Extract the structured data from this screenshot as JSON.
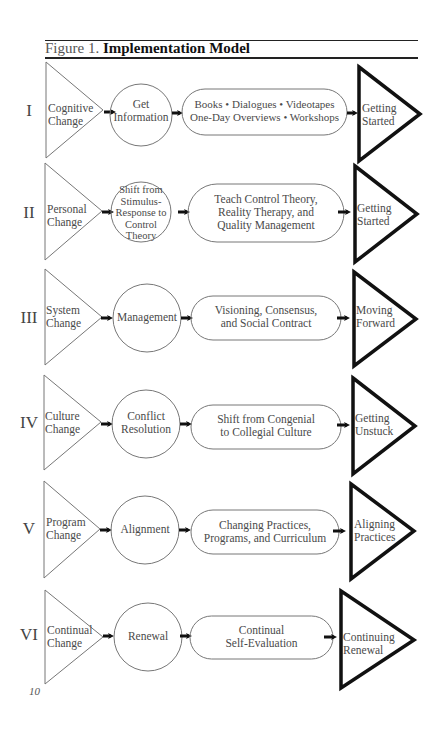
{
  "figure": {
    "prefix": "Figure 1.",
    "title": "Implementation Model"
  },
  "rows": [
    {
      "numeral": "I",
      "change": "Cognitive\nChange",
      "process": "Get\nInformation",
      "activities": "Books • Dialogues • Videotapes\nOne-Day Overviews • Workshops",
      "outcome": "Getting\nStarted"
    },
    {
      "numeral": "II",
      "change": "Personal\nChange",
      "process": "Shift from\nStimulus-\nResponse to\nControl\nTheory",
      "activities": "Teach Control Theory,\nReality Therapy, and\nQuality Management",
      "outcome": "Getting\nStarted"
    },
    {
      "numeral": "III",
      "change": "System\nChange",
      "process": "Management",
      "activities": "Visioning, Consensus,\nand Social Contract",
      "outcome": "Moving\nForward"
    },
    {
      "numeral": "IV",
      "change": "Culture\nChange",
      "process": "Conflict\nResolution",
      "activities": "Shift from Congenial\nto Collegial Culture",
      "outcome": "Getting\nUnstuck"
    },
    {
      "numeral": "V",
      "change": "Program\nChange",
      "process": "Alignment",
      "activities": "Changing Practices,\nPrograms, and Curriculum",
      "outcome": "Aligning\nPractices"
    },
    {
      "numeral": "VI",
      "change": "Continual\nChange",
      "process": "Renewal",
      "activities": "Continual\nSelf-Evaluation",
      "outcome": "Continuing\nRenewal"
    }
  ],
  "page": {
    "number": "10"
  },
  "colors": {
    "thin_stroke": "#777777",
    "bold_stroke": "#111111",
    "text": "#4a4a4a"
  }
}
